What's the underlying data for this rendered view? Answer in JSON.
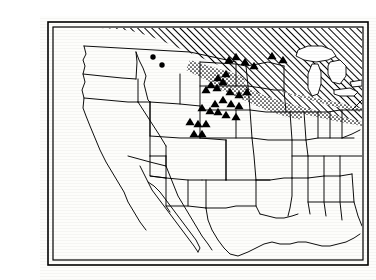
{
  "figure": {
    "kind": "distribution-map",
    "region": "United States and southern Canada",
    "projection_note": "outline map, state and provincial boundaries",
    "background_color": "#fdfdfb",
    "ink_color": "#000000",
    "title": "",
    "caption": ""
  },
  "frame": {
    "style": "double-rule rectangle",
    "outer": {
      "x": 8,
      "y": 6,
      "width": 320,
      "height": 243,
      "stroke_width": 1.6
    },
    "inner": {
      "x": 13,
      "y": 11,
      "width": 310,
      "height": 233,
      "stroke_width": 1.2
    },
    "color": "#000000"
  },
  "legend_symbols": [
    {
      "id": "hatched-range",
      "name": "hatched-range-area",
      "pattern": "diagonal-hatch",
      "meaning": "primary range",
      "color": "#000000"
    },
    {
      "id": "stippled-band",
      "name": "stippled-transition-band",
      "pattern": "stipple-dots",
      "meaning": "marginal / transition zone",
      "color": "#000000"
    },
    {
      "id": "triangle-marker",
      "name": "triangle-locality-marker",
      "pattern": "filled-triangle",
      "meaning": "collection locality",
      "color": "#000000"
    },
    {
      "id": "circle-marker",
      "name": "circle-locality-marker",
      "pattern": "filled-circle",
      "meaning": "outlying record",
      "color": "#000000"
    }
  ],
  "chart_data": {
    "type": "scatter",
    "title": "",
    "xlabel": "",
    "ylabel": "",
    "coordinate_space": "image pixels, 336 x 264",
    "xlim": [
      13,
      323
    ],
    "ylim": [
      11,
      244
    ],
    "grid": false,
    "legend_position": "none",
    "series": [
      {
        "name": "triangle-localities",
        "marker": "filled-triangle",
        "count": 29,
        "points": [
          [
            189,
            44
          ],
          [
            196,
            41
          ],
          [
            205,
            46
          ],
          [
            214,
            50
          ],
          [
            232,
            40
          ],
          [
            243,
            44
          ],
          [
            186,
            58
          ],
          [
            178,
            62
          ],
          [
            183,
            66
          ],
          [
            171,
            69
          ],
          [
            177,
            72
          ],
          [
            166,
            74
          ],
          [
            190,
            76
          ],
          [
            199,
            79
          ],
          [
            207,
            76
          ],
          [
            183,
            84
          ],
          [
            175,
            88
          ],
          [
            191,
            88
          ],
          [
            199,
            90
          ],
          [
            162,
            92
          ],
          [
            170,
            95
          ],
          [
            178,
            96
          ],
          [
            186,
            99
          ],
          [
            196,
            101
          ],
          [
            150,
            106
          ],
          [
            158,
            108
          ],
          [
            166,
            108
          ],
          [
            154,
            118
          ],
          [
            162,
            118
          ]
        ]
      },
      {
        "name": "circle-localities",
        "marker": "filled-circle",
        "count": 2,
        "points": [
          [
            113,
            41
          ],
          [
            122,
            49
          ]
        ]
      }
    ],
    "areas": [
      {
        "name": "hatched-range-area",
        "fill": "diagonal-hatch",
        "description": "broad band covering southern Canada, the upper Midwest and the Great Lakes region, reaching the right edge of the frame"
      },
      {
        "name": "stippled-transition-band",
        "fill": "stipple-dots",
        "description": "narrow speckled border along the southern and western margin of the hatched area, through the Dakotas, Minnesota, Iowa, Wisconsin, Michigan and Ohio"
      }
    ]
  },
  "accessibility": {
    "alt": "Black and white outline map of the United States and southern Canada. A diagonally hatched area covers southern Canada, the upper Midwest and the Great Lakes, bordered on its southern edge by a stippled band. Twenty-nine solid triangles mark localities across Montana, the Dakotas, Minnesota, Nebraska and Kansas, and two solid circles mark outlying records in Montana."
  }
}
